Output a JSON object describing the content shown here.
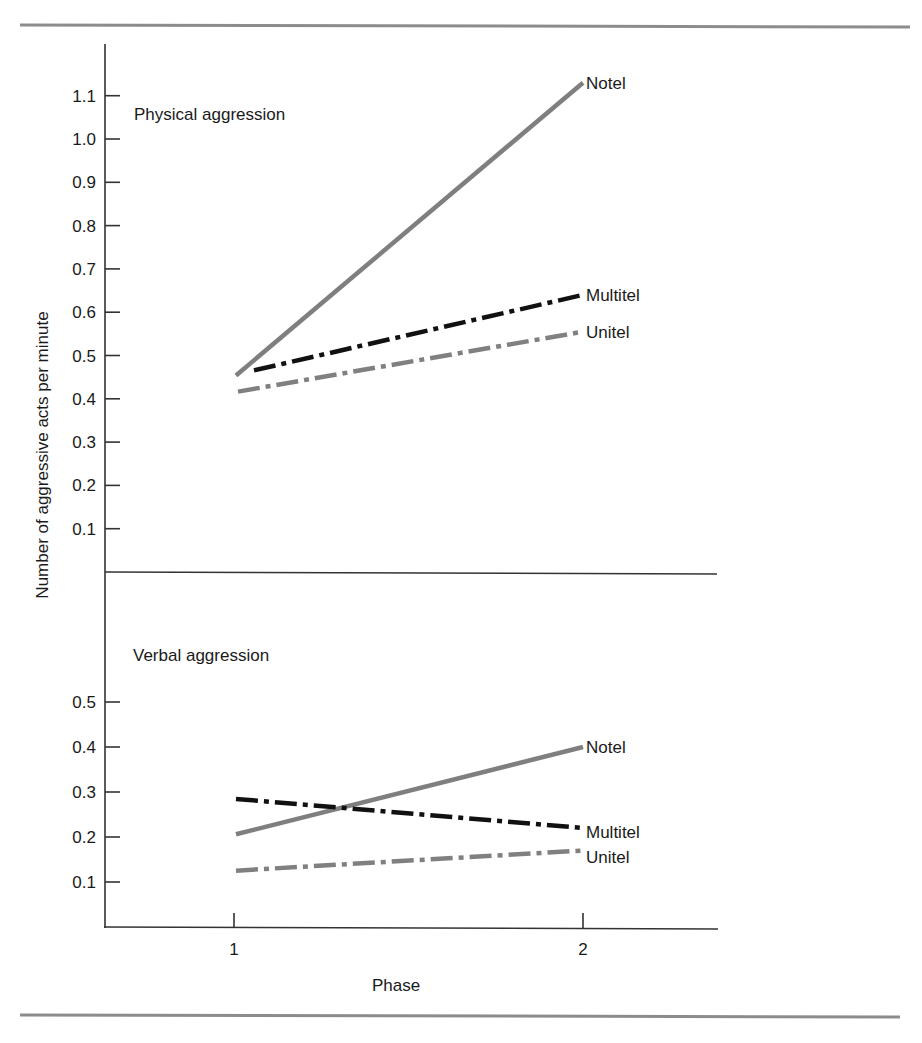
{
  "figure": {
    "y_axis_title": "Number of aggressive acts per minute",
    "x_axis_title": "Phase",
    "x_ticks": [
      "1",
      "2"
    ],
    "panels": [
      {
        "title": "Physical aggression",
        "y_ticks": [
          "0.1",
          "0.2",
          "0.3",
          "0.4",
          "0.5",
          "0.6",
          "0.7",
          "0.8",
          "0.9",
          "1.0",
          "1.1"
        ]
      },
      {
        "title": "Verbal aggression",
        "y_ticks": [
          "0.1",
          "0.2",
          "0.3",
          "0.4",
          "0.5"
        ]
      }
    ],
    "series_labels": {
      "notel": "Notel",
      "multitel": "Multitel",
      "unitel": "Unitel"
    },
    "colors": {
      "notel": "#7f7f7f",
      "multitel": "#111111",
      "unitel": "#808080",
      "axis": "#333333",
      "rule": "#8c8c8c"
    }
  },
  "chart_data": [
    {
      "type": "line",
      "title": "Physical aggression",
      "xlabel": "Phase",
      "ylabel": "Number of aggressive acts per minute",
      "categories": [
        1,
        2
      ],
      "ylim": [
        0,
        1.15
      ],
      "grid": false,
      "legend_position": "inline labels at line ends",
      "series": [
        {
          "name": "Notel",
          "values": [
            0.45,
            1.13
          ],
          "style": "solid gray"
        },
        {
          "name": "Multitel",
          "values": [
            0.455,
            0.64
          ],
          "style": "dash-dot black"
        },
        {
          "name": "Unitel",
          "values": [
            0.415,
            0.555
          ],
          "style": "dash-dot gray"
        }
      ]
    },
    {
      "type": "line",
      "title": "Verbal aggression",
      "xlabel": "Phase",
      "ylabel": "Number of aggressive acts per minute",
      "categories": [
        1,
        2
      ],
      "ylim": [
        0,
        0.55
      ],
      "grid": false,
      "legend_position": "inline labels at line ends",
      "series": [
        {
          "name": "Notel",
          "values": [
            0.205,
            0.4
          ],
          "style": "solid gray"
        },
        {
          "name": "Multitel",
          "values": [
            0.285,
            0.22
          ],
          "style": "dash-dot black"
        },
        {
          "name": "Unitel",
          "values": [
            0.125,
            0.17
          ],
          "style": "dash-dot gray"
        }
      ]
    }
  ]
}
